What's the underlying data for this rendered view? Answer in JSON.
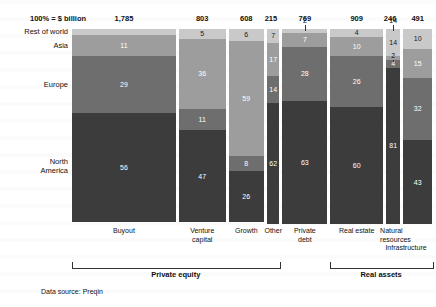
{
  "axis": {
    "percent_label": "100% = $ billion",
    "source_note": "Data source: Preqin"
  },
  "rows": [
    {
      "key": "rest_of_world",
      "label": "Rest of world",
      "color": "#c9c9c9"
    },
    {
      "key": "asia",
      "label": "Asia",
      "color": "#9d9d9d"
    },
    {
      "key": "europe",
      "label": "Europe",
      "color": "#6e6e6e"
    },
    {
      "key": "north_america",
      "label": "North\nAmerica",
      "label_line1": "North",
      "label_line2": "America",
      "color": "#3c3c3c"
    }
  ],
  "groups": [
    {
      "label": "Private equity",
      "columns": [
        "Buyout",
        "Venture capital",
        "Growth",
        "Other"
      ]
    },
    {
      "label": "Real assets",
      "columns": [
        "Real estate",
        "Natural resources",
        "Infrastructure"
      ]
    }
  ],
  "columns": [
    {
      "name": "Buyout",
      "label_line1": "Buyout",
      "label_line2": "",
      "total": "1,785"
    },
    {
      "name": "Venture capital",
      "label_line1": "Venture",
      "label_line2": "capital",
      "total": "803"
    },
    {
      "name": "Growth",
      "label_line1": "Growth",
      "label_line2": "",
      "total": "608"
    },
    {
      "name": "Other",
      "label_line1": "Other",
      "label_line2": "",
      "total": "215"
    },
    {
      "name": "Private debt",
      "label_line1": "Private",
      "label_line2": "debt",
      "total": "769"
    },
    {
      "name": "Real estate",
      "label_line1": "Real estate",
      "label_line2": "",
      "total": "909"
    },
    {
      "name": "Natural resources",
      "label_line1": "Natural",
      "label_line2": "resources",
      "total": "246"
    },
    {
      "name": "Infrastructure",
      "label_line1": "Infrastructure",
      "label_line2": "",
      "total": "491"
    }
  ],
  "chart_data": {
    "type": "bar",
    "subtype": "marimekko-stacked-100-percent",
    "title": "",
    "xlabel": "",
    "ylabel": "",
    "ylim": [
      0,
      100
    ],
    "grid": false,
    "legend_position": "row-labels-left",
    "categories": [
      "Buyout",
      "Venture capital",
      "Growth",
      "Other",
      "Private debt",
      "Real estate",
      "Natural resources",
      "Infrastructure"
    ],
    "column_totals_usd_billion": [
      1785,
      803,
      608,
      215,
      769,
      909,
      246,
      491
    ],
    "column_total_labels": [
      "1,785",
      "803",
      "608",
      "215",
      "769",
      "909",
      "246",
      "491"
    ],
    "series": [
      {
        "name": "Rest of world",
        "color": "#c9c9c9",
        "values": [
          3,
          5,
          6,
          7,
          2,
          4,
          14,
          10
        ]
      },
      {
        "name": "Asia",
        "color": "#9d9d9d",
        "values": [
          11,
          36,
          59,
          17,
          7,
          10,
          2,
          15
        ]
      },
      {
        "name": "Europe",
        "color": "#6e6e6e",
        "values": [
          29,
          11,
          8,
          14,
          28,
          26,
          4,
          32
        ]
      },
      {
        "name": "North America",
        "color": "#3c3c3c",
        "values": [
          56,
          47,
          26,
          62,
          63,
          60,
          81,
          43
        ]
      }
    ],
    "annotations": [
      {
        "text": "2",
        "belongs_to": "Private debt",
        "series": "Rest of world",
        "placement": "outside-above"
      },
      {
        "text": "14",
        "belongs_to": "Natural resources",
        "series": "Rest of world",
        "placement": "outside-above"
      },
      {
        "text": "2",
        "belongs_to": "Natural resources",
        "series": "Asia",
        "placement": "outside-above"
      },
      {
        "text": "4",
        "belongs_to": "Natural resources",
        "series": "Europe",
        "placement": "inside-small"
      }
    ]
  }
}
